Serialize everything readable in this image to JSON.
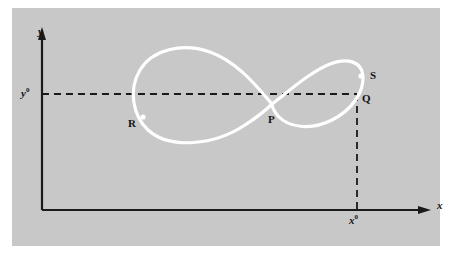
{
  "figure": {
    "panel": {
      "background_color": "#c8c8c8",
      "outer_background_color": "#ffffff"
    },
    "colors": {
      "curve": "#ffffff",
      "axis": "#1a1a1a",
      "dashed": "#1a1a1a",
      "label": "#141414"
    },
    "axes": {
      "y_axis_label": "y",
      "x_axis_label": "x",
      "origin": {
        "x": 42,
        "y": 210
      },
      "y_axis_top": 30,
      "x_axis_right": 430
    },
    "reference_lines": {
      "horizontal": {
        "label": "y",
        "superscript": "0",
        "value_text": "y0",
        "y_pixel": 94,
        "from_x": 42,
        "to_x": 357,
        "style": "dashed"
      },
      "vertical": {
        "label": "x",
        "superscript": "0",
        "value_text": "x0",
        "x_pixel": 357,
        "from_y": 94,
        "to_y": 210,
        "style": "dashed"
      }
    },
    "points": [
      {
        "id": "P",
        "label": "P",
        "x": 272,
        "y": 104,
        "marker": false,
        "note": "self-intersection of the curve"
      },
      {
        "id": "Q",
        "label": "Q",
        "x": 357,
        "y": 94,
        "marker": false,
        "note": "corner of the dashed reference lines"
      },
      {
        "id": "R",
        "label": "R",
        "x": 143,
        "y": 117,
        "marker": true,
        "note": "marked dot on left lobe"
      },
      {
        "id": "S",
        "label": "S",
        "x": 360,
        "y": 76,
        "marker": true,
        "note": "marked dot on right lobe"
      }
    ],
    "curve": {
      "type": "figure-eight",
      "stroke_width": 3,
      "description": "Large left lobe and smaller right lobe crossing at P"
    }
  }
}
